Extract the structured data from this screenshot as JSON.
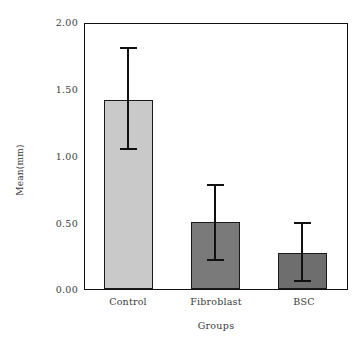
{
  "chart_data": {
    "type": "bar",
    "title": "",
    "xlabel": "Groups",
    "ylabel": "Mean(mm)",
    "categories": [
      "Control",
      "Fibroblast",
      "BSC"
    ],
    "values": [
      1.43,
      0.51,
      0.27
    ],
    "error_high": [
      1.83,
      0.79,
      0.5
    ],
    "error_low": [
      1.06,
      0.22,
      0.06
    ],
    "errors": [
      {
        "category": "Control",
        "mean": 1.43,
        "upper": 1.83,
        "lower": 1.06
      },
      {
        "category": "Fibroblast",
        "mean": 0.51,
        "upper": 0.79,
        "lower": 0.22
      },
      {
        "category": "BSC",
        "mean": 0.27,
        "upper": 0.5,
        "lower": 0.06
      }
    ],
    "bar_colors": [
      "#c9c9c9",
      "#7a7a7a",
      "#6e6e6e"
    ],
    "ylim": [
      0.0,
      2.0
    ],
    "yticks": [
      "0.00",
      "0.50",
      "1.00",
      "1.50",
      "2.00"
    ],
    "ytick_values": [
      0.0,
      0.5,
      1.0,
      1.5,
      2.0
    ],
    "grid": false,
    "legend": "none",
    "axis_color": "#111111"
  },
  "ytick_labels": {
    "t0": "0.00",
    "t1": "0.50",
    "t2": "1.00",
    "t3": "1.50",
    "t4": "2.00"
  },
  "xtick_labels": {
    "c0": "Control",
    "c1": "Fibroblast",
    "c2": "BSC"
  },
  "axis_titles": {
    "x": "Groups",
    "y": "Mean(mm)"
  }
}
